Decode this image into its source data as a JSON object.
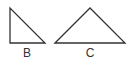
{
  "diagram": {
    "shapes": [
      {
        "id": "B",
        "type": "right-triangle",
        "label": "B",
        "points": "10,8 10,43 45,43"
      },
      {
        "id": "C",
        "type": "obtuse-triangle",
        "label": "C",
        "points": "55,43 90,8 125,43"
      }
    ],
    "stroke_color": "#333333",
    "background": "#ffffff"
  }
}
